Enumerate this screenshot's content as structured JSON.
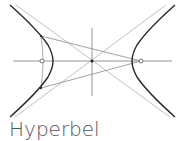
{
  "caption": "Hyperbel",
  "colors": {
    "curve": "#2a2a2a",
    "construction": "#9a9a9a",
    "axis": "#7a7a7a",
    "text": "#555555"
  },
  "diagram": {
    "center": [
      92,
      61
    ],
    "left_vertex": [
      53,
      61
    ],
    "right_vertex": [
      132,
      61
    ],
    "left_focus": [
      42,
      61
    ],
    "right_focus": [
      141,
      61
    ]
  }
}
